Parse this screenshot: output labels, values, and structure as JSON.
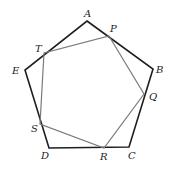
{
  "diagram": {
    "colors": {
      "outer": "#1e1e1e",
      "inner": "#7a7a7a",
      "label": "#222222",
      "background": "#ffffff"
    },
    "outer_polygon": {
      "name": "ABCDE",
      "vertices": [
        {
          "label": "A",
          "x": 87,
          "y": 21,
          "lx": 84,
          "ly": 17
        },
        {
          "label": "B",
          "x": 153,
          "y": 69,
          "lx": 156,
          "ly": 73
        },
        {
          "label": "C",
          "x": 129,
          "y": 147,
          "lx": 128,
          "ly": 159
        },
        {
          "label": "D",
          "x": 49,
          "y": 148,
          "lx": 41,
          "ly": 159
        },
        {
          "label": "E",
          "x": 25,
          "y": 70,
          "lx": 12,
          "ly": 74
        }
      ]
    },
    "inner_polygon": {
      "name": "PQRST",
      "vertices": [
        {
          "label": "P",
          "x": 109,
          "y": 36,
          "lx": 110,
          "ly": 32
        },
        {
          "label": "Q",
          "x": 144,
          "y": 94,
          "lx": 149,
          "ly": 100
        },
        {
          "label": "R",
          "x": 104,
          "y": 148,
          "lx": 100,
          "ly": 160
        },
        {
          "label": "S",
          "x": 40,
          "y": 124,
          "lx": 31,
          "ly": 132
        },
        {
          "label": "T",
          "x": 44,
          "y": 53,
          "lx": 35,
          "ly": 52
        }
      ]
    }
  }
}
